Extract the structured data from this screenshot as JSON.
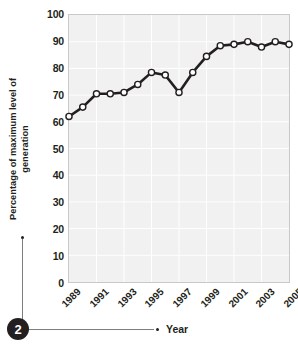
{
  "figure": {
    "badge_number": "2"
  },
  "axes": {
    "y_title": "Percentage of maximum level of\ngeneration",
    "x_title": "Year"
  },
  "chart_data": {
    "type": "line",
    "title": "",
    "subtitle": "",
    "xlabel": "Year",
    "ylabel": "Percentage of maximum level of generation",
    "x": [
      1989,
      1990,
      1991,
      1992,
      1993,
      1994,
      1995,
      1996,
      1997,
      1998,
      1999,
      2000,
      2001,
      2002,
      2003,
      2004,
      2005
    ],
    "values": [
      62,
      65.5,
      70.5,
      70.5,
      71,
      74,
      78.5,
      77.5,
      71,
      78.5,
      84.5,
      88.5,
      89,
      90,
      88,
      90,
      89
    ],
    "series": [
      {
        "name": "Percentage of maximum level of generation",
        "values": [
          62,
          65.5,
          70.5,
          70.5,
          71,
          74,
          78.5,
          77.5,
          71,
          78.5,
          84.5,
          88.5,
          89,
          90,
          88,
          90,
          89
        ]
      }
    ],
    "xlim": [
      1989,
      2005
    ],
    "ylim": [
      0,
      100
    ],
    "y_ticks": [
      0,
      10,
      20,
      30,
      40,
      50,
      60,
      70,
      80,
      90,
      100
    ],
    "y_tick_labels": [
      "0",
      "10",
      "20",
      "30",
      "40",
      "50",
      "60",
      "70",
      "80",
      "90",
      "100"
    ],
    "x_ticks": [
      1989,
      1991,
      1993,
      1995,
      1997,
      1999,
      2001,
      2003,
      2005
    ],
    "x_tick_labels": [
      "1989",
      "1991",
      "1993",
      "1995",
      "1997",
      "1999",
      "2001",
      "2003",
      "2005"
    ],
    "grid": true,
    "legend": "none",
    "marker": "open-circle",
    "line_color": "#231f20",
    "marker_fill": "#ffffff",
    "plot_bg_color": "#f1f1f1",
    "grid_color": "#ffffff"
  }
}
